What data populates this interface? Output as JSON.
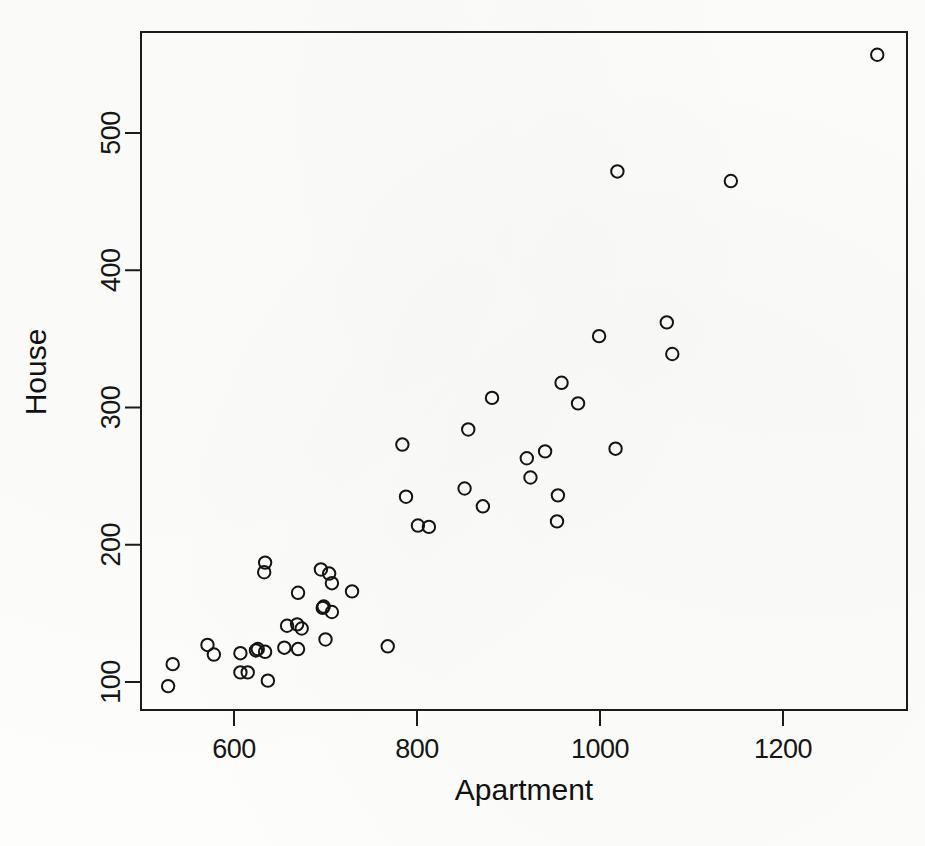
{
  "figure": {
    "kind": "scatterplot",
    "background_color": "#fdfdfb",
    "foreground_color": "#141414",
    "width": 925,
    "height": 846
  },
  "axes": {
    "x_title": "Apartment",
    "y_title": "House",
    "x_ticks": [
      "600",
      "800",
      "1000",
      "1200"
    ],
    "y_ticks": [
      "100",
      "200",
      "300",
      "400",
      "500"
    ]
  },
  "chart_data": {
    "type": "scatter",
    "title": "",
    "xlabel": "Apartment",
    "ylabel": "House",
    "xlim": [
      497,
      1340
    ],
    "ylim": [
      79,
      576
    ],
    "xticks": [
      600,
      800,
      1000,
      1200
    ],
    "yticks": [
      100,
      200,
      300,
      400,
      500
    ],
    "grid": false,
    "legend": null,
    "marker": "open-circle",
    "marker_color": "#141414",
    "n_points": 50,
    "series": [
      {
        "name": "Apartment vs House",
        "points": [
          [
            1303,
            557
          ],
          [
            1019,
            472
          ],
          [
            1143,
            465
          ],
          [
            1073,
            362
          ],
          [
            999,
            352
          ],
          [
            1079,
            339
          ],
          [
            958,
            318
          ],
          [
            882,
            307
          ],
          [
            976,
            303
          ],
          [
            856,
            284
          ],
          [
            784,
            273
          ],
          [
            1017,
            270
          ],
          [
            940,
            268
          ],
          [
            920,
            263
          ],
          [
            924,
            249
          ],
          [
            852,
            241
          ],
          [
            954,
            236
          ],
          [
            788,
            235
          ],
          [
            872,
            228
          ],
          [
            953,
            217
          ],
          [
            801,
            214
          ],
          [
            813,
            213
          ],
          [
            729,
            166
          ],
          [
            707,
            172
          ],
          [
            704,
            179
          ],
          [
            695,
            182
          ],
          [
            634,
            187
          ],
          [
            633,
            180
          ],
          [
            670,
            165
          ],
          [
            697,
            154
          ],
          [
            707,
            151
          ],
          [
            698,
            155
          ],
          [
            658,
            141
          ],
          [
            669,
            142
          ],
          [
            674,
            139
          ],
          [
            700,
            131
          ],
          [
            768,
            126
          ],
          [
            626,
            124
          ],
          [
            634,
            122
          ],
          [
            655,
            125
          ],
          [
            670,
            124
          ],
          [
            624,
            123
          ],
          [
            571,
            127
          ],
          [
            578,
            120
          ],
          [
            607,
            121
          ],
          [
            533,
            113
          ],
          [
            607,
            107
          ],
          [
            615,
            107
          ],
          [
            637,
            101
          ],
          [
            528,
            97
          ]
        ]
      }
    ]
  }
}
